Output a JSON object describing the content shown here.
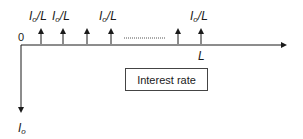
{
  "diagram": {
    "type": "cash-flow diagram",
    "origin_label": "0",
    "end_label": "L",
    "payment_label": {
      "base": "I",
      "sub": "o",
      "rest": "/L"
    },
    "initial_outflow_label": {
      "base": "I",
      "sub": "o"
    },
    "box_label": "Interest rate",
    "arrows_up_x": [
      41,
      63,
      87,
      111,
      178,
      201
    ],
    "labeled_arrows_x": [
      41,
      63,
      111,
      201
    ]
  }
}
